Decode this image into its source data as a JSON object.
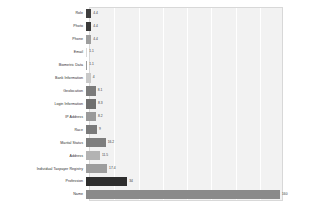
{
  "chart_data": {
    "type": "bar",
    "orientation": "horizontal",
    "title": "",
    "subtitle": "",
    "xlabel": "",
    "ylabel": "",
    "grid": true,
    "legend": false,
    "xlim": [
      0,
      160
    ],
    "categories": [
      "Role",
      "Photo",
      "Phone",
      "Email",
      "Biometric Data",
      "Bank Information",
      "Geolocation",
      "Login Information",
      "IP Address",
      "Race",
      "Marital Status",
      "Address",
      "Individual Taxpayer Registry",
      "Profession",
      "Name"
    ],
    "values": [
      4.4,
      4.4,
      4.4,
      1.1,
      1.1,
      4,
      8.1,
      8.3,
      8.2,
      9,
      16.2,
      11.5,
      17.4,
      34,
      160
    ],
    "value_labels": [
      "4.4",
      "4.4",
      "4.4",
      "1.1",
      "1.1",
      "4",
      "8.1",
      "8.3",
      "8.2",
      "9",
      "16.2",
      "11.5",
      "17.4",
      "34",
      "160"
    ],
    "bar_colors": [
      "#3f3f3f",
      "#3a3a3a",
      "#9e9e9e",
      "#d8d8d8",
      "#9c9c9c",
      "#c9c9c9",
      "#7b7b7b",
      "#6f6f6f",
      "#9a9a9a",
      "#7a7a7a",
      "#7e7e7e",
      "#b3b3b3",
      "#9d9d9d",
      "#2e2e2e",
      "#8a8a8a"
    ],
    "plot_background": "#f2f2f2",
    "gridline_color": "#ffffff",
    "gridline_positions": [
      20,
      40,
      60,
      80,
      100,
      120,
      140
    ],
    "tick_labels": []
  }
}
